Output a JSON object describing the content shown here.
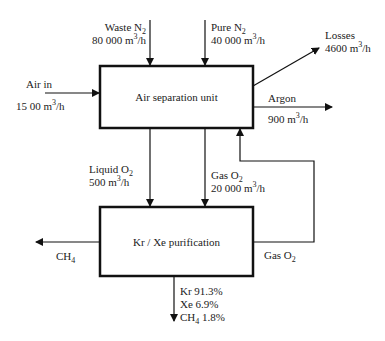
{
  "diagram": {
    "type": "process-flow",
    "boxes": {
      "asu": {
        "label": "Air separation unit"
      },
      "kr_xe": {
        "label": "Kr / Xe purification"
      }
    },
    "streams": {
      "waste_n2": {
        "name": "Waste N",
        "sub": "2",
        "flow_num": "80 000 m",
        "flow_sup": "3",
        "flow_unit": "/h"
      },
      "pure_n2": {
        "name": "Pure N",
        "sub": "2",
        "flow_num": "40 000 m",
        "flow_sup": "3",
        "flow_unit": "/h"
      },
      "air_in": {
        "name": "Air in",
        "flow_num": "15 00 m",
        "flow_sup": "3",
        "flow_unit": "/h"
      },
      "losses": {
        "name": "Losses",
        "flow_num": "4600 m",
        "flow_sup": "3",
        "flow_unit": "/h"
      },
      "argon": {
        "name": "Argon",
        "flow_num": "900 m",
        "flow_sup": "3",
        "flow_unit": "/h"
      },
      "liquid_o2": {
        "name": "Liquid O",
        "sub": "2",
        "flow_num": "500 m",
        "flow_sup": "3",
        "flow_unit": "/h"
      },
      "gas_o2": {
        "name": "Gas O",
        "sub": "2",
        "flow_num": "20 000 m",
        "flow_sup": "3",
        "flow_unit": "/h"
      },
      "gas_o2_return": {
        "name": "Gas O",
        "sub": "2"
      },
      "ch4_out": {
        "name": "CH",
        "sub": "4"
      },
      "product": {
        "kr": "Kr 91.3%",
        "xe": "Xe 6.9%",
        "ch4_name": "CH",
        "ch4_sub": "4",
        "ch4_pct": " 1.8%"
      }
    },
    "colors": {
      "line": "#111111",
      "text": "#222222",
      "background": "#ffffff"
    }
  }
}
